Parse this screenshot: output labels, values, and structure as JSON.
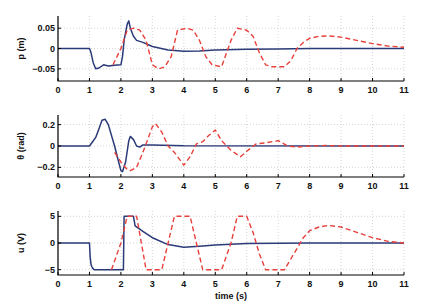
{
  "chart_data": [
    {
      "type": "line",
      "ylabel": "p (m)",
      "xlabel": "",
      "xlim": [
        0,
        11
      ],
      "ylim": [
        -0.08,
        0.08
      ],
      "xticks": [
        "0",
        "1",
        "2",
        "3",
        "4",
        "5",
        "6",
        "7",
        "8",
        "9",
        "10",
        "11"
      ],
      "yticks": [
        {
          "v": 0.05,
          "label": "0.05"
        },
        {
          "v": 0,
          "label": "0"
        },
        {
          "v": -0.05,
          "label": "−0.05"
        }
      ],
      "grid": true,
      "series": [
        {
          "name": "solid",
          "style": "solid",
          "color": "#2b3a78",
          "x": [
            0,
            1.0,
            1.05,
            1.12,
            1.2,
            1.3,
            1.45,
            1.6,
            1.8,
            2.0,
            2.05,
            2.1,
            2.2,
            2.25,
            2.3,
            2.4,
            2.5,
            2.7,
            3.0,
            3.5,
            4.0,
            4.5,
            5.0,
            6.0,
            7.0,
            8.0,
            9.0,
            10.0,
            11.0
          ],
          "y": [
            0,
            0,
            -0.01,
            -0.035,
            -0.05,
            -0.048,
            -0.04,
            -0.043,
            -0.041,
            -0.04,
            -0.02,
            0.02,
            0.06,
            0.068,
            0.05,
            0.03,
            0.02,
            0.015,
            0.005,
            -0.004,
            -0.007,
            -0.006,
            -0.004,
            -0.002,
            -0.001,
            0,
            0,
            0,
            0
          ]
        },
        {
          "name": "dashed",
          "style": "dashed",
          "color": "#e8403a",
          "x": [
            1.75,
            2.0,
            2.2,
            2.4,
            2.6,
            2.8,
            3.0,
            3.2,
            3.4,
            3.6,
            3.8,
            4.1,
            4.3,
            4.5,
            4.7,
            4.9,
            5.2,
            5.5,
            5.7,
            6.0,
            6.2,
            6.4,
            6.6,
            6.8,
            7.2,
            7.4,
            7.6,
            7.8,
            8.0,
            8.3,
            8.6,
            9.0,
            9.5,
            10.0,
            10.5,
            11.0
          ],
          "y": [
            -0.04,
            0.0,
            0.045,
            0.05,
            0.045,
            0.02,
            -0.04,
            -0.05,
            -0.045,
            -0.02,
            0.045,
            0.05,
            0.045,
            0.02,
            -0.02,
            -0.04,
            -0.045,
            0.02,
            0.05,
            0.045,
            0.03,
            -0.01,
            -0.04,
            -0.045,
            -0.045,
            -0.03,
            0.0,
            0.015,
            0.025,
            0.03,
            0.031,
            0.028,
            0.02,
            0.012,
            0.006,
            0.003
          ]
        }
      ]
    },
    {
      "type": "line",
      "ylabel": "θ (rad)",
      "xlabel": "",
      "xlim": [
        0,
        11
      ],
      "ylim": [
        -0.29,
        0.29
      ],
      "xticks": [
        "0",
        "1",
        "2",
        "3",
        "4",
        "5",
        "6",
        "7",
        "8",
        "9",
        "10",
        "11"
      ],
      "yticks": [
        {
          "v": 0.2,
          "label": "0.2"
        },
        {
          "v": 0,
          "label": "0"
        },
        {
          "v": -0.2,
          "label": "−0.2"
        }
      ],
      "grid": true,
      "series": [
        {
          "name": "solid",
          "style": "solid",
          "color": "#2b3a78",
          "x": [
            0,
            1.0,
            1.1,
            1.2,
            1.3,
            1.4,
            1.5,
            1.6,
            1.8,
            1.9,
            2.0,
            2.05,
            2.15,
            2.25,
            2.3,
            2.4,
            2.5,
            2.6,
            2.7,
            3.0,
            4.0,
            11.0
          ],
          "y": [
            0,
            0,
            0.04,
            0.08,
            0.16,
            0.24,
            0.25,
            0.2,
            0.0,
            -0.12,
            -0.23,
            -0.24,
            -0.15,
            0.05,
            0.09,
            0.06,
            0.0,
            -0.01,
            0.01,
            0.01,
            0.003,
            0.0
          ]
        },
        {
          "name": "dashed",
          "style": "dashed",
          "color": "#e8403a",
          "x": [
            1.8,
            2.0,
            2.2,
            2.3,
            2.5,
            2.7,
            3.0,
            3.1,
            3.3,
            3.5,
            3.7,
            4.0,
            4.2,
            4.4,
            4.6,
            4.8,
            5.0,
            5.2,
            5.5,
            5.8,
            6.0,
            6.3,
            6.6,
            7.0,
            7.3,
            7.6,
            8.0,
            8.5,
            9.0,
            11.0
          ],
          "y": [
            -0.06,
            -0.15,
            -0.22,
            -0.23,
            -0.2,
            -0.06,
            0.18,
            0.21,
            0.13,
            0.0,
            -0.06,
            -0.18,
            -0.1,
            0.02,
            0.04,
            0.1,
            0.15,
            0.05,
            -0.04,
            -0.1,
            -0.05,
            0.02,
            0.03,
            0.05,
            0.0,
            -0.01,
            0.0,
            0.005,
            0.0,
            0.0
          ]
        }
      ]
    },
    {
      "type": "line",
      "ylabel": "u (V)",
      "xlabel": "time (s)",
      "xlim": [
        0,
        11
      ],
      "ylim": [
        -6,
        6
      ],
      "xticks": [
        "0",
        "1",
        "2",
        "3",
        "4",
        "5",
        "6",
        "7",
        "8",
        "9",
        "10",
        "11"
      ],
      "yticks": [
        {
          "v": 5,
          "label": "5"
        },
        {
          "v": 0,
          "label": "0"
        },
        {
          "v": -5,
          "label": "−5"
        }
      ],
      "grid": true,
      "series": [
        {
          "name": "solid",
          "style": "solid",
          "color": "#2b3a78",
          "x": [
            0,
            1.0,
            1.02,
            1.05,
            1.08,
            1.1,
            1.15,
            1.5,
            2.0,
            2.08,
            2.1,
            2.4,
            2.45,
            2.7,
            3.0,
            3.5,
            4.0,
            4.5,
            5.0,
            6.0,
            7.0,
            8.0,
            9.0,
            10.0,
            11.0
          ],
          "y": [
            0,
            0,
            -2.5,
            -4.0,
            -4.5,
            -4.7,
            -5,
            -5,
            -5,
            -5,
            5,
            5,
            3.2,
            2.2,
            1.0,
            -0.3,
            -0.8,
            -0.6,
            -0.35,
            -0.1,
            -0.03,
            0,
            0,
            0,
            0
          ]
        },
        {
          "name": "dashed",
          "style": "dashed",
          "color": "#e8403a",
          "x": [
            1.7,
            2.0,
            2.2,
            2.5,
            2.8,
            3.0,
            3.3,
            3.5,
            3.7,
            4.0,
            4.2,
            4.4,
            4.6,
            4.8,
            5.2,
            5.5,
            5.7,
            6.0,
            6.2,
            6.4,
            6.6,
            6.8,
            7.2,
            7.4,
            7.6,
            7.8,
            8.0,
            8.3,
            8.6,
            9.0,
            9.5,
            10.0,
            10.5,
            11.0
          ],
          "y": [
            -5,
            0,
            5,
            5,
            -5,
            -5,
            -5,
            0,
            5,
            5,
            5,
            0,
            -5,
            -5,
            -5,
            0,
            5,
            5,
            2,
            -2,
            -5,
            -5,
            -5,
            -3,
            -1,
            1,
            2.3,
            3.0,
            3.3,
            3.0,
            2.0,
            1.0,
            0.3,
            0.0
          ]
        }
      ]
    }
  ],
  "figure": {
    "panels": [
      "p-panel",
      "theta-panel",
      "u-panel"
    ],
    "colors": {
      "solid": "#2b3a78",
      "dashed": "#e8403a"
    }
  }
}
